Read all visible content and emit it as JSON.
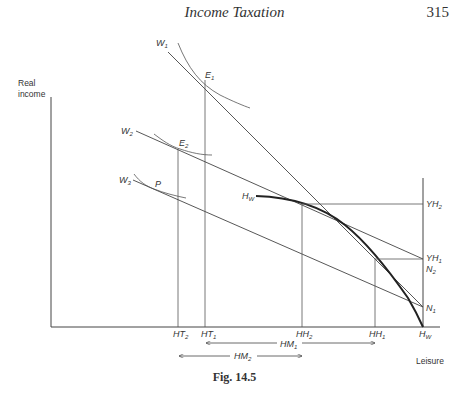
{
  "page": {
    "header_title": "Income Taxation",
    "page_number": "315",
    "caption": "Fig. 14.5"
  },
  "axes": {
    "y_label_line1": "Real",
    "y_label_line2": "income",
    "x_label": "Leisure"
  },
  "labels": {
    "W1": {
      "base": "W",
      "sub": "1"
    },
    "W2": {
      "base": "W",
      "sub": "2"
    },
    "W3": {
      "base": "W",
      "sub": "3"
    },
    "E1": {
      "base": "E",
      "sub": "1"
    },
    "E2": {
      "base": "E",
      "sub": "2"
    },
    "P": {
      "base": "P",
      "sub": ""
    },
    "Hw_curve": {
      "base": "H",
      "sub": "W"
    },
    "YH2": {
      "base": "YH",
      "sub": "2"
    },
    "YH1": {
      "base": "YH",
      "sub": "1"
    },
    "N2": {
      "base": "N",
      "sub": "2"
    },
    "N1": {
      "base": "N",
      "sub": "1"
    }
  },
  "x_ticks": [
    {
      "base": "HT",
      "sub": "2"
    },
    {
      "base": "HT",
      "sub": "1"
    },
    {
      "base": "HH",
      "sub": "2"
    },
    {
      "base": "HH",
      "sub": "1"
    },
    {
      "base": "H",
      "sub": "W"
    }
  ],
  "spans": {
    "HM1": {
      "base": "HM",
      "sub": "1"
    },
    "HM2": {
      "base": "HM",
      "sub": "2"
    }
  }
}
